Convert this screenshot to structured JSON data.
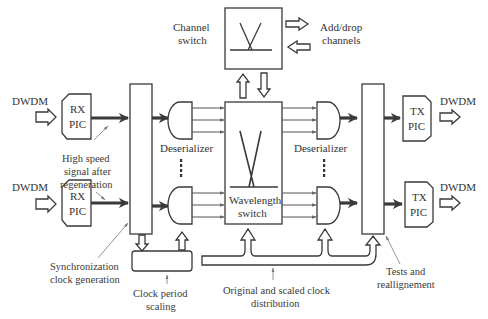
{
  "diagram": {
    "inputs": [
      {
        "label": "DWDM",
        "pic": {
          "line1": "RX",
          "line2": "PIC"
        }
      },
      {
        "label": "DWDM",
        "pic": {
          "line1": "RX",
          "line2": "PIC"
        }
      }
    ],
    "outputs": [
      {
        "label": "DWDM",
        "pic": {
          "line1": "TX",
          "line2": "PIC"
        }
      },
      {
        "label": "DWDM",
        "pic": {
          "line1": "TX",
          "line2": "PIC"
        }
      }
    ],
    "channel_switch": {
      "line1": "Channel",
      "line2": "switch"
    },
    "add_drop": {
      "line1": "Add/drop",
      "line2": "channels"
    },
    "deserializer_left": "Deserializer",
    "deserializer_right": "Deserializer",
    "wavelength_switch": {
      "line1": "Wavelength",
      "line2": "switch"
    },
    "annotations": {
      "high_speed": {
        "line1": "High speed",
        "line2": "signal after",
        "line3": "regeneration"
      },
      "sync_clock": {
        "line1": "Synchronization",
        "line2": "clock generation"
      },
      "clock_period": {
        "line1": "Clock period",
        "line2": "scaling"
      },
      "clock_distribution": {
        "line1": "Original and scaled clock",
        "line2": "distribution"
      },
      "tests": {
        "line1": "Tests and",
        "line2": "reallignement"
      }
    },
    "colors": {
      "stroke": "#3a3a3a",
      "text": "#333333",
      "background": "#ffffff"
    }
  }
}
